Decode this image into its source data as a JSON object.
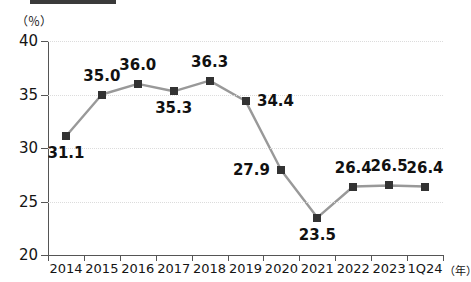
{
  "chart_data": {
    "type": "line",
    "title": "",
    "xlabel": "年",
    "ylabel": "",
    "unit_label": "（％）",
    "x_unit_suffix": "（年）",
    "categories": [
      "2014",
      "2015",
      "2016",
      "2017",
      "2018",
      "2019",
      "2020",
      "2021",
      "2022",
      "2023",
      "1Q24"
    ],
    "values": [
      31.1,
      35.0,
      36.0,
      35.3,
      36.3,
      34.4,
      27.9,
      23.5,
      26.4,
      26.5,
      26.4
    ],
    "data_labels": [
      "31.1",
      "35.0",
      "36.0",
      "35.3",
      "36.3",
      "34.4",
      "27.9",
      "23.5",
      "26.4",
      "26.5",
      "26.4"
    ],
    "label_positions": [
      "below",
      "above",
      "above",
      "below",
      "above",
      "right",
      "left",
      "below",
      "above",
      "above",
      "above"
    ],
    "ylim": [
      20,
      40
    ],
    "yticks": [
      20,
      25,
      30,
      35,
      40
    ],
    "ytick_labels": [
      "20",
      "25",
      "30",
      "35",
      "40"
    ],
    "grid": true,
    "legend": "none",
    "series_color": "#999999",
    "marker_color": "#333333",
    "axis_color": "#555555",
    "grid_color": "#dcdcdc",
    "background": "#ffffff"
  }
}
